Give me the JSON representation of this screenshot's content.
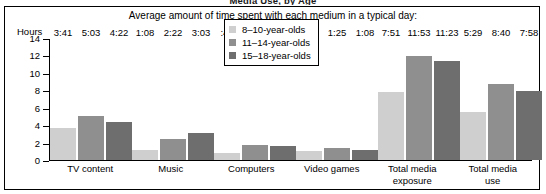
{
  "figure": {
    "heading": "Media Use, by Age",
    "subtitle": "Average amount of time spent with each medium in a typical day:"
  },
  "chart_data": {
    "type": "bar",
    "title": "Media Use, by Age",
    "subtitle": "Average amount of time spent with each medium in a typical day:",
    "xlabel": "",
    "ylabel": "Hours",
    "ylim": [
      0,
      14
    ],
    "yticks": [
      0,
      2,
      4,
      6,
      8,
      10,
      12,
      14
    ],
    "ytick_labels": [
      "0",
      "2",
      "4",
      "6",
      "8",
      "10",
      "12",
      "14"
    ],
    "grid": false,
    "legend_position": "upper-center",
    "categories": [
      "TV content",
      "Music",
      "Computers",
      "Video games",
      "Total media exposure",
      "Total media use"
    ],
    "category_lines": [
      [
        "TV content"
      ],
      [
        "Music"
      ],
      [
        "Computers"
      ],
      [
        "Video games"
      ],
      [
        "Total media",
        "exposure"
      ],
      [
        "Total media",
        "use"
      ]
    ],
    "series": [
      {
        "name": "8–10-year-olds",
        "color": "#cfcfcf",
        "labels": [
          "3:41",
          "1:08",
          ":46",
          "1:01",
          "7:51",
          "5:29"
        ],
        "values": [
          3.683,
          1.133,
          0.767,
          1.017,
          7.85,
          5.483
        ]
      },
      {
        "name": "11–14-year-olds",
        "color": "#8f8f8f",
        "labels": [
          "5:03",
          "2:22",
          "1:46",
          "1:25",
          "11:53",
          "8:40"
        ],
        "values": [
          5.05,
          2.367,
          1.767,
          1.417,
          11.883,
          8.667
        ]
      },
      {
        "name": "15–18-year-olds",
        "color": "#6e6e6e",
        "labels": [
          "4:22",
          "3:03",
          "1:39",
          "1:08",
          "11:23",
          "7:58"
        ],
        "values": [
          4.367,
          3.05,
          1.65,
          1.133,
          11.383,
          7.967
        ]
      }
    ]
  }
}
